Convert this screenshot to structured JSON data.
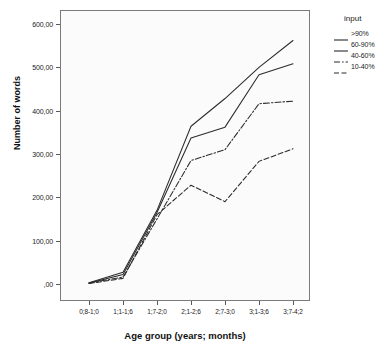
{
  "chart_data": {
    "type": "line",
    "title": "",
    "xlabel": "Age group (years; months)",
    "ylabel": "Number of words",
    "categories": [
      "0;8-1;0",
      "1;1-1;6",
      "1;7-2;0",
      "2;1-2;6",
      "2;7-3;0",
      "3;1-3;6",
      "3;7-4;2"
    ],
    "ylim": [
      0,
      640
    ],
    "yticks": [
      0,
      100,
      200,
      300,
      400,
      500,
      600
    ],
    "ytick_labels": [
      ",00",
      "100,00",
      "200,00",
      "300,00",
      "400,00",
      "500,00",
      "600,00"
    ],
    "grid": false,
    "legend_position": "right",
    "legend_title": "input",
    "series": [
      {
        "name": ">90%",
        "style": "solid",
        "values": [
          3,
          27,
          170,
          364,
          428,
          500,
          562
        ]
      },
      {
        "name": "60-90%",
        "style": "solid",
        "values": [
          2,
          22,
          165,
          337,
          362,
          483,
          508
        ]
      },
      {
        "name": "40-60%",
        "style": "dash-dot",
        "values": [
          2,
          16,
          150,
          285,
          310,
          416,
          422
        ]
      },
      {
        "name": "10-40%",
        "style": "dashed",
        "values": [
          1,
          13,
          160,
          228,
          190,
          283,
          312
        ]
      }
    ]
  },
  "legend": {
    "title": "input",
    "entries": [
      {
        "label": ">90%",
        "style": "solid"
      },
      {
        "label": "60-90%",
        "style": "solid"
      },
      {
        "label": "40-60%",
        "style": "dash-dot"
      },
      {
        "label": "10-40%",
        "style": "dashed"
      }
    ]
  },
  "colors": {
    "line": "#2b2b2b",
    "axis": "#7b7b7b",
    "plot_background": "#fbfbfb",
    "page_background": "#ffffff",
    "text": "#1b1b1b"
  }
}
